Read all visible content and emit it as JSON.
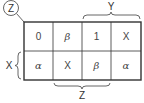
{
  "diagram": {
    "type": "karnaugh-map",
    "corner_label": "Z",
    "column_group_top": {
      "label": "Y",
      "spans_columns": [
        3,
        4
      ]
    },
    "column_group_bottom": {
      "label": "Z",
      "spans_columns": [
        2,
        3
      ]
    },
    "row_group_left": {
      "label": "X",
      "spans_rows": [
        2
      ]
    },
    "rows": [
      [
        "0",
        "β",
        "1",
        "X"
      ],
      [
        "α",
        "X",
        "β",
        "α"
      ]
    ]
  }
}
